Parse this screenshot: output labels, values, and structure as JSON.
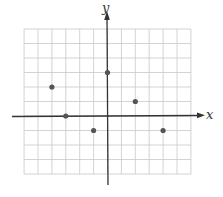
{
  "chart_data": {
    "type": "scatter",
    "title": "",
    "xlabel": "x",
    "ylabel": "y",
    "xlim": [
      -6,
      6
    ],
    "ylim": [
      -4,
      6
    ],
    "grid": true,
    "tick_labels": false,
    "points": [
      {
        "x": -4,
        "y": 2
      },
      {
        "x": -3,
        "y": 0
      },
      {
        "x": -1,
        "y": -1
      },
      {
        "x": 0,
        "y": 3
      },
      {
        "x": 2,
        "y": 1
      },
      {
        "x": 4,
        "y": -1
      }
    ],
    "colors": {
      "grid": "#c8c8c8",
      "axis": "#333333",
      "point": "#555555"
    }
  }
}
